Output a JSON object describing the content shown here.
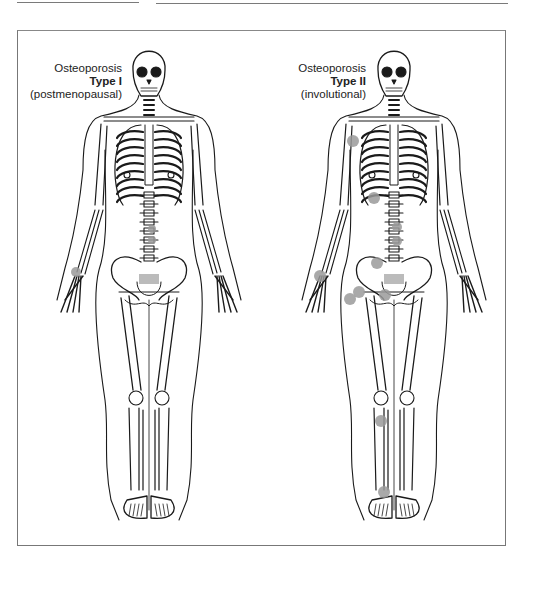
{
  "figure": {
    "panels": [
      {
        "id": "type1",
        "title_line1": "Osteoporosis",
        "title_line2": "Type I",
        "title_line3": "(postmenopausal)",
        "center_x": 149,
        "fracture_sites": [
          {
            "site": "distal-radius",
            "x": 76,
            "y": 272,
            "r": 5
          },
          {
            "site": "lumbar-vertebra-1",
            "x": 152,
            "y": 229,
            "r": 4
          },
          {
            "site": "lumbar-vertebra-2",
            "x": 152,
            "y": 240,
            "r": 4
          }
        ]
      },
      {
        "id": "type2",
        "title_line1": "Osteoporosis",
        "title_line2": "Type II",
        "title_line3": "(involutional)",
        "center_x": 394,
        "fracture_sites": [
          {
            "site": "proximal-humerus",
            "x": 353,
            "y": 141,
            "r": 6
          },
          {
            "site": "ribs",
            "x": 374,
            "y": 198,
            "r": 6
          },
          {
            "site": "thoracic-vertebra",
            "x": 397,
            "y": 227,
            "r": 5
          },
          {
            "site": "lumbar-vertebra",
            "x": 397,
            "y": 241,
            "r": 5
          },
          {
            "site": "pelvis-ilium",
            "x": 377,
            "y": 263,
            "r": 6
          },
          {
            "site": "distal-radius",
            "x": 320,
            "y": 276,
            "r": 6
          },
          {
            "site": "femoral-neck",
            "x": 359,
            "y": 292,
            "r": 6
          },
          {
            "site": "proximal-femur",
            "x": 350,
            "y": 299,
            "r": 6
          },
          {
            "site": "pubic-ramus",
            "x": 385,
            "y": 295,
            "r": 6
          },
          {
            "site": "proximal-tibia",
            "x": 381,
            "y": 421,
            "r": 6
          },
          {
            "site": "distal-tibia",
            "x": 384,
            "y": 492,
            "r": 6
          }
        ]
      }
    ],
    "colors": {
      "line": "#1a1a1a",
      "fracture_dot": "#9a9a9a",
      "frame": "#777777"
    }
  }
}
